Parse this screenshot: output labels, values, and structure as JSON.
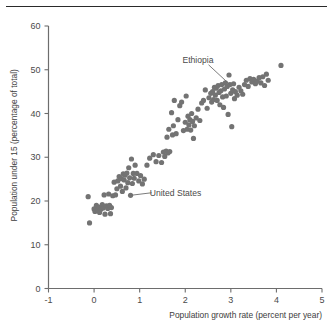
{
  "figure": {
    "has_top_rule": true,
    "background_color": "#ffffff",
    "point_color": "#737373",
    "axis_color": "#6d6d6d",
    "text_color": "#4a4a4a"
  },
  "chart_data": {
    "type": "scatter",
    "title": "",
    "xlabel": "Population growth rate (percent per year)",
    "ylabel": "Population under 15 (percentage of total)",
    "xlim": [
      -1,
      5
    ],
    "ylim": [
      0,
      60
    ],
    "xticks": [
      -1,
      0,
      1,
      2,
      3,
      4,
      5
    ],
    "xticklabels": [
      "-1",
      "0",
      "1",
      "2",
      "3",
      "4",
      "5"
    ],
    "yticks": [
      0,
      10,
      20,
      30,
      40,
      50,
      60
    ],
    "yticklabels": [
      "0",
      "10",
      "20",
      "30",
      "40",
      "50",
      "60"
    ],
    "grid": false,
    "legend": null,
    "marker": "circle",
    "marker_size": 5.2,
    "annotations": [
      {
        "text": "Ethiopia",
        "label_x": 2.62,
        "label_y": 51.6,
        "point_x": 2.98,
        "point_y": 46.6
      },
      {
        "text": "United States",
        "label_x": 1.22,
        "label_y": 21.2,
        "point_x": 0.8,
        "point_y": 21.3
      }
    ],
    "points": [
      [
        -0.13,
        21.0
      ],
      [
        -0.1,
        15.0
      ],
      [
        0.0,
        18.2
      ],
      [
        0.02,
        17.6
      ],
      [
        0.05,
        19.0
      ],
      [
        0.08,
        18.0
      ],
      [
        0.1,
        18.6
      ],
      [
        0.12,
        17.4
      ],
      [
        0.15,
        18.1
      ],
      [
        0.18,
        19.2
      ],
      [
        0.2,
        18.4
      ],
      [
        0.22,
        21.4
      ],
      [
        0.24,
        17.0
      ],
      [
        0.27,
        18.9
      ],
      [
        0.3,
        18.3
      ],
      [
        0.32,
        21.6
      ],
      [
        0.34,
        19.0
      ],
      [
        0.36,
        17.1
      ],
      [
        0.38,
        18.5
      ],
      [
        0.41,
        21.2
      ],
      [
        0.44,
        24.3
      ],
      [
        0.47,
        21.4
      ],
      [
        0.5,
        22.8
      ],
      [
        0.52,
        24.6
      ],
      [
        0.55,
        25.6
      ],
      [
        0.58,
        23.4
      ],
      [
        0.6,
        25.1
      ],
      [
        0.62,
        22.2
      ],
      [
        0.64,
        26.2
      ],
      [
        0.66,
        24.8
      ],
      [
        0.68,
        25.9
      ],
      [
        0.7,
        23.0
      ],
      [
        0.72,
        26.4
      ],
      [
        0.74,
        24.2
      ],
      [
        0.76,
        27.6
      ],
      [
        0.78,
        25.3
      ],
      [
        0.8,
        21.3
      ],
      [
        0.82,
        29.6
      ],
      [
        0.84,
        24.0
      ],
      [
        0.86,
        26.3
      ],
      [
        0.88,
        25.2
      ],
      [
        0.9,
        28.2
      ],
      [
        0.94,
        26.3
      ],
      [
        0.98,
        24.6
      ],
      [
        1.02,
        25.8
      ],
      [
        1.06,
        23.9
      ],
      [
        1.1,
        25.0
      ],
      [
        1.16,
        28.2
      ],
      [
        1.22,
        29.8
      ],
      [
        1.3,
        30.6
      ],
      [
        1.36,
        29.0
      ],
      [
        1.42,
        30.4
      ],
      [
        1.48,
        28.8
      ],
      [
        1.52,
        31.2
      ],
      [
        1.55,
        30.2
      ],
      [
        1.58,
        31.4
      ],
      [
        1.6,
        34.6
      ],
      [
        1.62,
        31.0
      ],
      [
        1.64,
        36.4
      ],
      [
        1.66,
        31.3
      ],
      [
        1.7,
        40.2
      ],
      [
        1.72,
        35.1
      ],
      [
        1.74,
        37.2
      ],
      [
        1.76,
        43.0
      ],
      [
        1.8,
        35.4
      ],
      [
        1.84,
        38.6
      ],
      [
        1.88,
        41.8
      ],
      [
        1.92,
        42.6
      ],
      [
        1.96,
        36.1
      ],
      [
        2.0,
        38.0
      ],
      [
        2.02,
        44.0
      ],
      [
        2.04,
        36.4
      ],
      [
        2.06,
        39.4
      ],
      [
        2.08,
        37.4
      ],
      [
        2.1,
        38.6
      ],
      [
        2.12,
        36.2
      ],
      [
        2.14,
        40.0
      ],
      [
        2.16,
        38.2
      ],
      [
        2.18,
        34.3
      ],
      [
        2.2,
        37.2
      ],
      [
        2.24,
        39.0
      ],
      [
        2.28,
        41.0
      ],
      [
        2.32,
        38.4
      ],
      [
        2.36,
        42.4
      ],
      [
        2.4,
        43.0
      ],
      [
        2.44,
        45.4
      ],
      [
        2.48,
        41.2
      ],
      [
        2.52,
        43.6
      ],
      [
        2.56,
        44.6
      ],
      [
        2.58,
        42.6
      ],
      [
        2.6,
        45.0
      ],
      [
        2.62,
        43.2
      ],
      [
        2.64,
        46.0
      ],
      [
        2.66,
        44.2
      ],
      [
        2.68,
        45.8
      ],
      [
        2.7,
        43.0
      ],
      [
        2.72,
        46.4
      ],
      [
        2.74,
        44.8
      ],
      [
        2.76,
        42.0
      ],
      [
        2.78,
        45.2
      ],
      [
        2.8,
        46.6
      ],
      [
        2.82,
        43.8
      ],
      [
        2.84,
        41.4
      ],
      [
        2.86,
        45.6
      ],
      [
        2.88,
        47.0
      ],
      [
        2.9,
        44.0
      ],
      [
        2.92,
        46.2
      ],
      [
        2.94,
        39.8
      ],
      [
        2.96,
        48.8
      ],
      [
        2.98,
        46.6
      ],
      [
        3.0,
        44.6
      ],
      [
        3.02,
        37.0
      ],
      [
        3.04,
        45.4
      ],
      [
        3.06,
        46.8
      ],
      [
        3.08,
        43.4
      ],
      [
        3.1,
        45.0
      ],
      [
        3.14,
        44.2
      ],
      [
        3.18,
        46.0
      ],
      [
        3.22,
        45.2
      ],
      [
        3.26,
        44.4
      ],
      [
        3.3,
        46.6
      ],
      [
        3.34,
        47.6
      ],
      [
        3.38,
        46.2
      ],
      [
        3.42,
        48.0
      ],
      [
        3.46,
        47.2
      ],
      [
        3.5,
        47.8
      ],
      [
        3.54,
        46.8
      ],
      [
        3.58,
        47.4
      ],
      [
        3.62,
        48.2
      ],
      [
        3.66,
        47.0
      ],
      [
        3.7,
        48.4
      ],
      [
        3.74,
        46.4
      ],
      [
        3.78,
        49.0
      ],
      [
        3.82,
        47.6
      ],
      [
        4.1,
        51.0
      ]
    ]
  }
}
